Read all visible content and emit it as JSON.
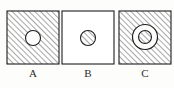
{
  "figure": {
    "type": "technical-diagram",
    "background_color": "#fdfdfc",
    "stroke_color": "#1e1e1e",
    "hatch_color": "#3a3a3a",
    "hatch_angle_deg": 45,
    "hatch_spacing_px": 4,
    "items": [
      {
        "id": "A",
        "label": "A",
        "square": {
          "x": 7,
          "y": 11,
          "width": 52,
          "height": 53,
          "fill": "hatched"
        },
        "shapes": [
          {
            "kind": "circle",
            "cx": 33,
            "cy": 38,
            "r": 7.5,
            "fill": "white"
          }
        ]
      },
      {
        "id": "B",
        "label": "B",
        "square": {
          "x": 62,
          "y": 11,
          "width": 52,
          "height": 53,
          "fill": "white"
        },
        "shapes": [
          {
            "kind": "circle",
            "cx": 88,
            "cy": 38,
            "r": 7.5,
            "fill": "hatched"
          }
        ]
      },
      {
        "id": "C",
        "label": "C",
        "square": {
          "x": 119,
          "y": 11,
          "width": 52,
          "height": 53,
          "fill": "hatched"
        },
        "shapes": [
          {
            "kind": "circle",
            "cx": 145,
            "cy": 37,
            "r": 12.5,
            "fill": "white"
          },
          {
            "kind": "circle",
            "cx": 145,
            "cy": 37,
            "r": 6.5,
            "fill": "hatched"
          }
        ]
      }
    ]
  }
}
